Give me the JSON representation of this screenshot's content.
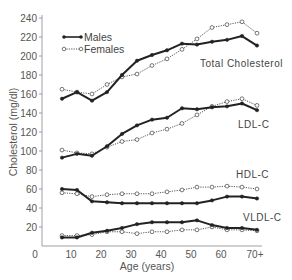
{
  "chart_data": {
    "type": "line",
    "title": "",
    "xlabel": "Age (years)",
    "ylabel": "Cholesterol (mg/dl)",
    "xlim": [
      0,
      80
    ],
    "ylim": [
      0,
      240
    ],
    "x_ticks": [
      "0",
      "10",
      "20",
      "30",
      "40",
      "50",
      "60",
      "70+"
    ],
    "y_ticks": [
      "0",
      "20",
      "40",
      "60",
      "80",
      "100",
      "120",
      "140",
      "160",
      "180",
      "200",
      "220",
      "240"
    ],
    "grid": false,
    "legend": {
      "position": "upper-left",
      "entries": [
        {
          "name": "Males",
          "style": "solid line, filled markers"
        },
        {
          "name": "Females",
          "style": "dotted line, open markers"
        }
      ]
    },
    "x": [
      7,
      12,
      17,
      22,
      27,
      32,
      37,
      42,
      47,
      52,
      57,
      62,
      67,
      72
    ],
    "groups": [
      {
        "label": "Total Cholesterol",
        "series": [
          {
            "name": "Males",
            "values": [
              155,
              162,
              153,
              162,
              180,
              195,
              201,
              206,
              213,
              212,
              215,
              217,
              221,
              211
            ]
          },
          {
            "name": "Females",
            "values": [
              165,
              162,
              160,
              170,
              178,
              181,
              190,
              197,
              207,
              218,
              230,
              233,
              236,
              224
            ]
          }
        ]
      },
      {
        "label": "LDL-C",
        "series": [
          {
            "name": "Males",
            "values": [
              93,
              97,
              95,
              105,
              118,
              127,
              133,
              135,
              145,
              144,
              146,
              147,
              150,
              143
            ]
          },
          {
            "name": "Females",
            "values": [
              101,
              98,
              97,
              104,
              110,
              112,
              119,
              123,
              129,
              138,
              147,
              152,
              155,
              148
            ]
          }
        ]
      },
      {
        "label": "HDL-C",
        "series": [
          {
            "name": "Males",
            "values": [
              60,
              59,
              47,
              46,
              45,
              45,
              45,
              45,
              45,
              45,
              48,
              52,
              52,
              50
            ]
          },
          {
            "name": "Females",
            "values": [
              56,
              55,
              52,
              54,
              55,
              55,
              55,
              57,
              59,
              62,
              62,
              63,
              62,
              60
            ]
          }
        ]
      },
      {
        "label": "VLDL-C",
        "series": [
          {
            "name": "Males",
            "values": [
              9,
              9,
              14,
              16,
              19,
              23,
              25,
              25,
              25,
              27,
              22,
              19,
              19,
              17
            ]
          },
          {
            "name": "Females",
            "values": [
              11,
              11,
              12,
              15,
              15,
              13,
              15,
              15,
              17,
              17,
              20,
              17,
              17,
              16
            ]
          }
        ]
      }
    ],
    "annotations": [
      {
        "text": "Total Cholesterol",
        "x_px": 200,
        "y_px": 64
      },
      {
        "text": "LDL-C",
        "x_px": 238,
        "y_px": 126
      },
      {
        "text": "HDL-C",
        "x_px": 236,
        "y_px": 176
      },
      {
        "text": "VLDL-C",
        "x_px": 243,
        "y_px": 219
      }
    ]
  },
  "ui": {
    "xlabel": "Age (years)",
    "ylabel": "Cholesterol (mg/dl)",
    "legend_males": "Males",
    "legend_females": "Females",
    "label_total": "Total Cholesterol",
    "label_ldl": "LDL-C",
    "label_hdl": "HDL-C",
    "label_vldl": "VLDL-C",
    "colors": {
      "male_line": "#222222",
      "female_line": "#555555",
      "axis": "#888888",
      "text": "#555555"
    }
  }
}
